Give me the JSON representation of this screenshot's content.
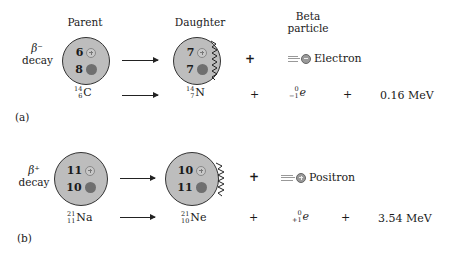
{
  "headers": {
    "parent": "Parent",
    "daughter": "Daughter",
    "beta_line1": "Beta",
    "beta_line2": "particle"
  },
  "panels": [
    {
      "label": "(a)",
      "decay_symbol": "β⁻",
      "decay_word": "decay",
      "parent": {
        "protons": "6",
        "neutrons": "8",
        "mass": "14",
        "atomic": "6",
        "element": "C"
      },
      "daughter": {
        "protons": "7",
        "neutrons": "7",
        "mass": "14",
        "atomic": "7",
        "element": "N"
      },
      "particle": {
        "name": "Electron",
        "charge": "minus",
        "mass": "0",
        "atomic": "−1",
        "symbol": "e"
      },
      "energy": "0.16 MeV",
      "plus": "+"
    },
    {
      "label": "(b)",
      "decay_symbol": "β⁺",
      "decay_word": "decay",
      "parent": {
        "protons": "11",
        "neutrons": "10",
        "mass": "21",
        "atomic": "11",
        "element": "Na"
      },
      "daughter": {
        "protons": "10",
        "neutrons": "11",
        "mass": "21",
        "atomic": "10",
        "element": "Ne"
      },
      "particle": {
        "name": "Positron",
        "charge": "plus",
        "mass": "0",
        "atomic": "+1",
        "symbol": "e"
      },
      "energy": "3.54 MeV",
      "plus": "+"
    }
  ],
  "colors": {
    "nucleus_fill": "#bdbdbd",
    "neutron": "#6f6f6f",
    "proton_outline": "#888888"
  }
}
